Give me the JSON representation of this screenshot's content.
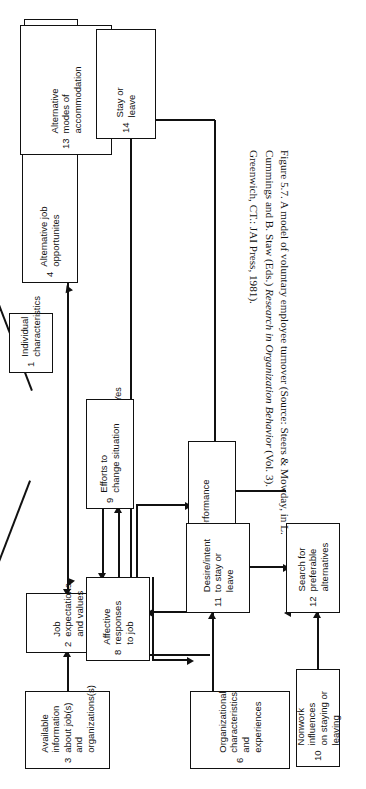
{
  "figure": {
    "caption_lead": "Figure 5.7. A model of voluntary employee turnover (Source: Steers & Mowday,",
    "caption_line2_a": "in L. Cummings and B. Staw (Eds.) ",
    "caption_line2_italic": "Research in Organization Behavior",
    "caption_line2_b": " (Vol. 3).",
    "caption_line3": "Greenwich, CT.: JAI Press, 1981).",
    "orientation": "rotated-90-ccw",
    "ink_color": "#111111",
    "paper_color": "#ffffff"
  },
  "diagram": {
    "type": "flowchart",
    "nodes": [
      {
        "id": "1",
        "num": "1",
        "label": "Individual\ncharacteristics"
      },
      {
        "id": "2",
        "num": "2",
        "label": "Job expectations\nand values"
      },
      {
        "id": "3",
        "num": "3",
        "label": "Available information\nabout job(s) and\norganizations(s)"
      },
      {
        "id": "4",
        "num": "4",
        "label": "Alternative job\nopportunites"
      },
      {
        "id": "5",
        "num": "5",
        "label": "Economic and market\nconditions"
      },
      {
        "id": "6",
        "num": "6",
        "label": "Organizational\ncharacteristics\nand experiences"
      },
      {
        "id": "7",
        "num": "7",
        "label": "Job performance\nlevel"
      },
      {
        "id": "8",
        "num": "8",
        "label": "Affective responses\nto job"
      },
      {
        "id": "9",
        "num": "9",
        "label": "Efforts to\nchange situation"
      },
      {
        "id": "10",
        "num": "10",
        "label": "Nonwork influences\non staying or leaving"
      },
      {
        "id": "11",
        "num": "11",
        "label": "Desire/intent\nto stay or leave"
      },
      {
        "id": "12",
        "num": "12",
        "label": "Search for\npreferable\nalternatives"
      },
      {
        "id": "13",
        "num": "13",
        "label": "Alternative\nmodes of\naccommodation"
      },
      {
        "id": "14",
        "num": "14",
        "label": "Stay or\nleave"
      }
    ],
    "edge_labels": {
      "yes": "Yes",
      "no": "No"
    }
  }
}
